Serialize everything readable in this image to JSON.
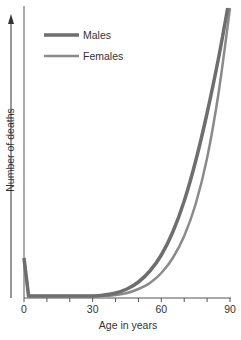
{
  "chart_data": {
    "type": "line",
    "title": "",
    "xlabel": "Age in years",
    "ylabel": "Number of deaths",
    "xlim": [
      0,
      90
    ],
    "x_ticks": [
      0,
      30,
      60,
      90
    ],
    "x_minor_ticks": [
      10,
      20,
      40,
      50,
      70,
      80
    ],
    "y_ticks": [],
    "grid": false,
    "legend_position": "upper-left",
    "series": [
      {
        "name": "Males",
        "color": "#6e6e6e",
        "width": 3.5,
        "x": [
          0,
          2,
          10,
          20,
          30,
          35,
          40,
          45,
          50,
          55,
          60,
          65,
          70,
          75,
          80,
          85,
          89
        ],
        "y": [
          40,
          2,
          2,
          2,
          2,
          3,
          5,
          9,
          16,
          27,
          43,
          66,
          97,
          137,
          185,
          240,
          290
        ]
      },
      {
        "name": "Females",
        "color": "#8a8a8a",
        "width": 2.5,
        "x": [
          0,
          2,
          10,
          20,
          30,
          35,
          40,
          45,
          50,
          55,
          60,
          65,
          70,
          75,
          80,
          85,
          90
        ],
        "y": [
          40,
          2,
          2,
          2,
          2,
          2,
          3,
          5,
          9,
          15,
          25,
          40,
          62,
          94,
          140,
          205,
          290
        ]
      }
    ]
  }
}
